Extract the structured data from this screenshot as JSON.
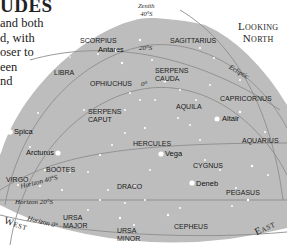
{
  "intro": {
    "heading": "UDES",
    "lines": [
      "and both",
      "d, with",
      "oser to",
      "een",
      "nd"
    ]
  },
  "zenith": {
    "label": "Zenith",
    "value": "40°S"
  },
  "view": {
    "line1": "Looking",
    "line2": "North"
  },
  "directions": {
    "west": "West",
    "east": "East"
  },
  "lines": {
    "ecliptic": "Ecliptic",
    "dec20": "20°S",
    "dec0": "0°",
    "horizon40": "Horizon 40°S",
    "horizon20": "Horizon 20°S",
    "horizon0": "Horizon 0°"
  },
  "constellations": {
    "scorpius": "SCORPIUS",
    "sagittarius": "SAGITTARIUS",
    "libra": "LIBRA",
    "ophiuchus": "OPHIUCHUS",
    "serpens_cauda_1": "SERPENS",
    "serpens_cauda_2": "CAUDA",
    "capricornus": "CAPRICORNUS",
    "serpens_caput_1": "SERPENS",
    "serpens_caput_2": "CAPUT",
    "aquila": "AQUILA",
    "aquarius": "AQUARIUS",
    "hercules": "HERCULES",
    "bootes": "BOÖTES",
    "cygnus": "CYGNUS",
    "virgo": "VIRGO",
    "draco": "DRACO",
    "pegasus": "PEGASUS",
    "ursa_major_1": "URSA",
    "ursa_major_2": "MAJOR",
    "ursa_minor_1": "URSA",
    "ursa_minor_2": "MINOR",
    "cepheus": "CEPHEUS"
  },
  "stars": {
    "antares": "Antares",
    "altair": "Altair",
    "spica": "Spica",
    "arcturus": "Arcturus",
    "vega": "Vega",
    "deneb": "Deneb"
  },
  "colors": {
    "sky": "#bdbdbd",
    "lines": "#8a8a8a",
    "star": "#ffffff",
    "text": "#1a1a1a"
  }
}
